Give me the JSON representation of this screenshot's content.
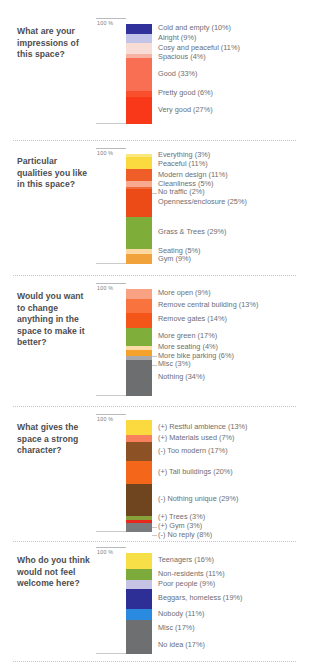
{
  "meta": {
    "axis_label": "100 %",
    "bar_left_px": 132,
    "bar_width_px": 26
  },
  "chart_data": {
    "type": "bar",
    "title": "",
    "subtype": "stacked-100-percent",
    "xlabel": "",
    "ylabel": "100 %",
    "ylim": [
      0,
      100
    ],
    "grid": false,
    "legend": "inline-right-labels",
    "charts": [
      {
        "question": "What are your impressions of this space?",
        "categories": [
          "Cold and empty",
          "Alright",
          "Cosy and peaceful",
          "Spacious",
          "Good",
          "Pretty good",
          "Very good"
        ],
        "values": [
          10,
          9,
          11,
          4,
          33,
          6,
          27
        ],
        "labels": [
          "Cold and empty (10%)",
          "Alright (9%)",
          "Cosy and peaceful (11%)",
          "Spacious (4%)",
          "Good (33%)",
          "Pretty good (6%)",
          "Very good (27%)"
        ],
        "colors": [
          "#30319a",
          "#c3c5e8",
          "#f7ddd6",
          "#f6b3a4",
          "#f96f53",
          "#fa4f2d",
          "#f9381a"
        ]
      },
      {
        "question": "Particular qualities you like in this space?",
        "categories": [
          "Everything",
          "Peaceful",
          "Modern design",
          "Cleanliness",
          "No traffic",
          "Openness/enclosure",
          "Grass & Trees",
          "Seating",
          "Gym"
        ],
        "values": [
          3,
          11,
          11,
          5,
          2,
          25,
          29,
          5,
          9
        ],
        "labels": [
          "Everything (3%)",
          "Peaceful (11%)",
          "Modern design (11%)",
          "Cleanliness (5%)",
          "No traffic (2%)",
          "Openness/enclosure (25%)",
          "Grass & Trees (29%)",
          "Seating (5%)",
          "Gym (9%)"
        ],
        "colors": [
          "#fbe87e",
          "#fada3e",
          "#ef5e28",
          "#f9a98f",
          "#f06a3c",
          "#ec4b18",
          "#7ead3a",
          "#fbd9a0",
          "#f2a23a"
        ]
      },
      {
        "question": "Would you want to change anything in the space to make it better?",
        "categories": [
          "More open",
          "Remove central building",
          "Remove gates",
          "More green",
          "More seating",
          "More bike parking",
          "Misc",
          "Nothing"
        ],
        "values": [
          9,
          13,
          14,
          17,
          4,
          6,
          3,
          34
        ],
        "labels": [
          "More open (9%)",
          "Remove central building (13%)",
          "Remove gates (14%)",
          "More green (17%)",
          "More seating (4%)",
          "More bike parking (6%)",
          "Misc (3%)",
          "Nothing (34%)"
        ],
        "colors": [
          "#f9a183",
          "#f9733f",
          "#f4561a",
          "#7fae3b",
          "#fbdca6",
          "#f4a22b",
          "#a8a9aa",
          "#6d6e70"
        ]
      },
      {
        "question": "What gives the space a strong character?",
        "categories": [
          "(+) Restful ambience",
          "(+) Materials used",
          "(-) Too modern",
          "(+) Tall buildings",
          "(-) Nothing unique",
          "(+) Trees",
          "(+) Gym",
          "(-) No reply"
        ],
        "values": [
          13,
          7,
          17,
          20,
          29,
          3,
          3,
          8
        ],
        "labels": [
          "(+) Restful ambience (13%)",
          "(+) Materials used (7%)",
          "(-) Too modern (17%)",
          "(+) Tall buildings (20%)",
          "(-) Nothing unique (29%)",
          "(+) Trees (3%)",
          "(+) Gym (3%)",
          "(-) No reply (8%)"
        ],
        "colors": [
          "#fada3e",
          "#f9805c",
          "#8c5226",
          "#f4671a",
          "#6e451f",
          "#89a13a",
          "#e8281c",
          "#7a7b7d"
        ]
      },
      {
        "question": "Who do you think would not feel welcome here?",
        "categories": [
          "Teenagers",
          "Non-residents",
          "Poor people",
          "Beggars, homeless",
          "Nobody",
          "Misc",
          "No idea"
        ],
        "values": [
          16,
          11,
          9,
          19,
          11,
          17,
          17
        ],
        "labels": [
          "Teenagers (16%)",
          "Non-residents (11%)",
          "Poor people (9%)",
          "Beggars, homeless (19%)",
          "Nobody (11%)",
          "Misc (17%)",
          "No idea (17%)"
        ],
        "colors": [
          "#f7df47",
          "#7cab3c",
          "#c5c2e4",
          "#2e2f96",
          "#2a8ae0",
          "#6e6f71",
          "#6e6f71"
        ]
      }
    ]
  },
  "blocks": [
    {
      "top": 14,
      "bar_top": 24,
      "bar_height": 100,
      "chart": 0
    },
    {
      "top": 148,
      "bar_top": 154,
      "bar_height": 110,
      "chart": 1
    },
    {
      "top": 283,
      "bar_top": 289,
      "bar_height": 107,
      "chart": 2
    },
    {
      "top": 414,
      "bar_top": 420,
      "bar_height": 112,
      "chart": 3
    },
    {
      "top": 549,
      "bar_top": 553,
      "bar_height": 101,
      "chart": 4
    }
  ],
  "dividers": [
    140,
    275,
    406,
    541,
    661
  ]
}
